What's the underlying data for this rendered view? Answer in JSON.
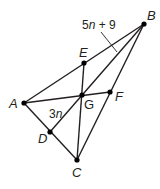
{
  "diagram": {
    "type": "triangle-centroid",
    "points": {
      "A": {
        "label": "A",
        "x": 24,
        "y": 103
      },
      "B": {
        "label": "B",
        "x": 144,
        "y": 24
      },
      "C": {
        "label": "C",
        "x": 77,
        "y": 160
      },
      "D": {
        "label": "D",
        "x": 50,
        "y": 132
      },
      "E": {
        "label": "E",
        "x": 84,
        "y": 63
      },
      "F": {
        "label": "F",
        "x": 110,
        "y": 92
      },
      "G": {
        "label": "G",
        "x": 82,
        "y": 95
      }
    },
    "segment_labels": {
      "BG": {
        "coef": "5",
        "var": "n",
        "rest": " + 9"
      },
      "GD": {
        "coef": "3",
        "var": "n"
      }
    },
    "colors": {
      "line": "#231f20",
      "point": "#000000",
      "background": "#ffffff"
    }
  }
}
